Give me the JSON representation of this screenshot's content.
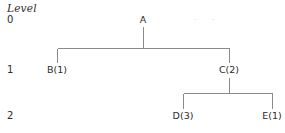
{
  "diagram": {
    "caption": "Level",
    "levels": [
      {
        "id": "level-0",
        "label": "0"
      },
      {
        "id": "level-1",
        "label": "1"
      },
      {
        "id": "level-2",
        "label": "2"
      }
    ],
    "nodes": [
      {
        "id": "node-a",
        "label": "A",
        "level": 0,
        "x": 143,
        "y": 20
      },
      {
        "id": "node-b",
        "label": "B(1)",
        "level": 1,
        "x": 57,
        "y": 71
      },
      {
        "id": "node-c",
        "label": "C(2)",
        "level": 1,
        "x": 229,
        "y": 71
      },
      {
        "id": "node-d",
        "label": "D(3)",
        "level": 2,
        "x": 183,
        "y": 117
      },
      {
        "id": "node-e",
        "label": "E(1)",
        "level": 2,
        "x": 272,
        "y": 117
      }
    ],
    "edges": [
      {
        "from": "node-a",
        "to": "node-b"
      },
      {
        "from": "node-a",
        "to": "node-c"
      },
      {
        "from": "node-c",
        "to": "node-d"
      },
      {
        "from": "node-c",
        "to": "node-e"
      }
    ],
    "ellipsis": "· ·",
    "colors": {
      "line": "#8a8a8a",
      "text": "#2b2b2b",
      "ellipsis": "#d8d8d8",
      "background": "#ffffff"
    }
  }
}
